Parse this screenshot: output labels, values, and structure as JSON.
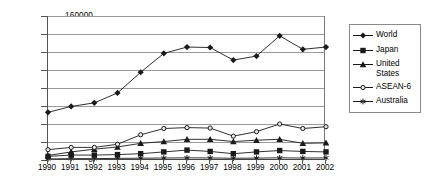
{
  "chart_data": {
    "type": "line",
    "title": "",
    "subtitle": "",
    "xlabel": "",
    "ylabel": "",
    "categories": [
      "1990",
      "1991",
      "1992",
      "1993",
      "1994",
      "1995",
      "1996",
      "1997",
      "1998",
      "1999",
      "2000",
      "2001",
      "2002"
    ],
    "x": [
      1990,
      1991,
      1992,
      1993,
      1994,
      1995,
      1996,
      1997,
      1998,
      1999,
      2000,
      2001,
      2002
    ],
    "ylim": [
      0,
      160000
    ],
    "xlim": [
      1990,
      2002
    ],
    "y_ticks": [
      0,
      20000,
      40000,
      60000,
      80000,
      100000,
      120000,
      140000,
      160000
    ],
    "y_tick_labels": [
      "0",
      "20000",
      "40000",
      "60000",
      "80000",
      "100000",
      "120000",
      "140000",
      "160000"
    ],
    "grid": true,
    "grid_axis": "y",
    "legend_position": "right",
    "series": [
      {
        "name": "World",
        "marker": "diamond",
        "color": "#1a1a1a",
        "values": [
          53000,
          59500,
          63500,
          74500,
          97500,
          118500,
          125500,
          125000,
          111000,
          115500,
          138000,
          123000,
          125500
        ]
      },
      {
        "name": "Japan",
        "marker": "square",
        "color": "#1a1a1a",
        "values": [
          4000,
          5500,
          5500,
          6000,
          7000,
          9000,
          11000,
          9500,
          7000,
          9000,
          10500,
          9500,
          9000
        ]
      },
      {
        "name": "United States",
        "marker": "triangle",
        "color": "#1a1a1a",
        "values": [
          5000,
          9000,
          12000,
          14500,
          18500,
          20500,
          23000,
          23000,
          20500,
          22000,
          23000,
          18500,
          19000
        ]
      },
      {
        "name": "ASEAN-6",
        "marker": "circle",
        "color": "#1a1a1a",
        "values": [
          11500,
          14000,
          14000,
          17500,
          28000,
          35000,
          36000,
          35500,
          26500,
          31500,
          40000,
          35000,
          37000
        ]
      },
      {
        "name": "Australia",
        "marker": "asterisk",
        "color": "#1a1a1a",
        "values": [
          1200,
          1500,
          1500,
          1800,
          2000,
          2200,
          2400,
          2300,
          1900,
          2100,
          2400,
          2200,
          2300
        ]
      }
    ]
  },
  "legend": {
    "items": [
      {
        "label": "World"
      },
      {
        "label": "Japan"
      },
      {
        "label": "United\nStates"
      },
      {
        "label": "ASEAN-6"
      },
      {
        "label": "Australia"
      }
    ]
  }
}
